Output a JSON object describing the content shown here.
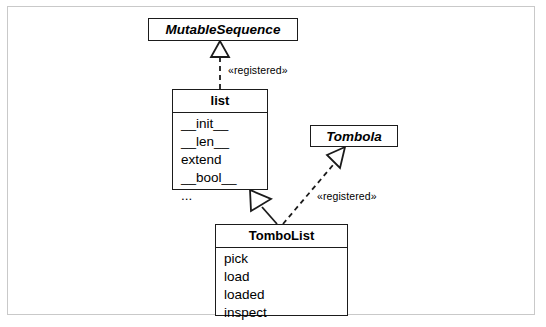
{
  "diagram": {
    "type": "uml-class-diagram",
    "frame": {
      "border_color": "#c9c9c9",
      "background": "#ffffff"
    },
    "line_color": "#1b1b1b",
    "classes": [
      {
        "id": "mutablesequence",
        "name": "MutableSequence",
        "stereotype": "abstract",
        "members": []
      },
      {
        "id": "list",
        "name": "list",
        "stereotype": "concrete",
        "members": [
          "__init__",
          "__len__",
          "extend",
          "__bool__",
          "..."
        ]
      },
      {
        "id": "tombola",
        "name": "Tombola",
        "stereotype": "abstract",
        "members": []
      },
      {
        "id": "tombolist",
        "name": "TomboList",
        "stereotype": "concrete",
        "members": [
          "pick",
          "load",
          "loaded",
          "inspect"
        ]
      }
    ],
    "relationships": [
      {
        "id": "list-registered-mutablesequence",
        "from": "list",
        "to": "mutablesequence",
        "kind": "realization",
        "line": "dashed",
        "arrowhead": "hollow-triangle",
        "label": "«registered»"
      },
      {
        "id": "tombolist-inherits-list",
        "from": "tombolist",
        "to": "list",
        "kind": "generalization",
        "line": "solid",
        "arrowhead": "hollow-triangle",
        "label": ""
      },
      {
        "id": "tombolist-registered-tombola",
        "from": "tombolist",
        "to": "tombola",
        "kind": "realization",
        "line": "dashed",
        "arrowhead": "hollow-triangle",
        "label": "«registered»"
      }
    ]
  }
}
